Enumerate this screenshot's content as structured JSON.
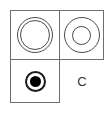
{
  "figure": {
    "stroke_color": "#6e6e6e",
    "glyph_color": "#4a4a4a",
    "fill_color": "#000000",
    "background": "#ffffff"
  },
  "cells": {
    "top_left": {
      "symbol_name": "thin-double-ring",
      "label": ""
    },
    "top_right": {
      "symbol_name": "wide-double-ring",
      "label": ""
    },
    "bottom_left": {
      "symbol_name": "filled-dot-in-ring",
      "label": ""
    },
    "bottom_right": {
      "symbol_name": "letter-label",
      "label": "C"
    }
  }
}
